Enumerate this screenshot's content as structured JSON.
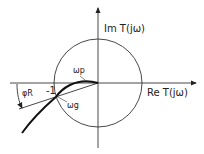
{
  "diagram": {
    "axis_labels": {
      "imag": "Im T(jω)",
      "real": "Re T(jω)"
    },
    "point_labels": {
      "minus_one": "-1",
      "omega_p": "ωp",
      "omega_g": "ωg",
      "phi_r": "φR"
    },
    "elements": [
      "unit-circle",
      "real-axis",
      "imag-axis",
      "nyquist-curve",
      "phase-margin-line",
      "phase-margin-arc"
    ],
    "colors": {
      "stroke": "#222222",
      "background": "#ffffff"
    }
  }
}
